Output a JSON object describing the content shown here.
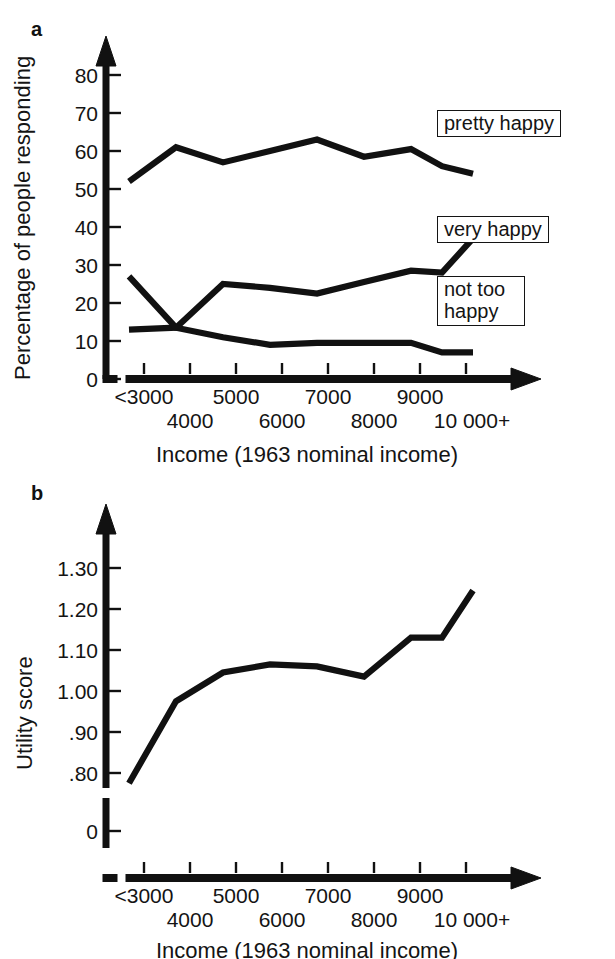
{
  "figure": {
    "panels": [
      {
        "letter": "a",
        "ylabel": "Percentage of people responding",
        "xlabel": "Income (1963 nominal income)"
      },
      {
        "letter": "b",
        "ylabel": "Utility score",
        "xlabel": "Income (1963 nominal income)"
      }
    ],
    "legend": {
      "pretty_happy": "pretty happy",
      "very_happy": "very happy",
      "not_too_happy": "not too\nhappy"
    },
    "colors": {
      "line": "#111111",
      "text": "#141414",
      "background": "#ffffff"
    }
  },
  "chart_data": [
    {
      "type": "line",
      "panel": "a",
      "title": "",
      "xlabel": "Income (1963 nominal income)",
      "ylabel": "Percentage of people responding",
      "categories": [
        "<3000",
        "4000",
        "5000",
        "6000",
        "7000",
        "8000",
        "9000",
        "10 000+"
      ],
      "xtick_labels_row1": [
        "<3000",
        "5000",
        "7000",
        "9000"
      ],
      "xtick_labels_row2": [
        "4000",
        "6000",
        "8000",
        "10 000+"
      ],
      "x": [
        1,
        2,
        3,
        4,
        5,
        6,
        7,
        8,
        9
      ],
      "ylim": [
        0,
        88
      ],
      "ytick_labels": [
        "0",
        "10",
        "20",
        "30",
        "40",
        "50",
        "60",
        "70",
        "80"
      ],
      "ytick_values": [
        0,
        10,
        20,
        30,
        40,
        50,
        60,
        70,
        80
      ],
      "grid": false,
      "legend_position": "inside-right",
      "axis_break_x": true,
      "series": [
        {
          "name": "pretty happy",
          "values": [
            52,
            61,
            57,
            60,
            63,
            58.5,
            60.5,
            56,
            54
          ]
        },
        {
          "name": "very happy",
          "values": [
            13,
            13.5,
            25,
            24,
            22.5,
            25.5,
            28.5,
            28,
            37
          ]
        },
        {
          "name": "not too happy",
          "values": [
            27,
            13.5,
            11,
            9,
            9.5,
            9.5,
            9.5,
            7,
            7
          ]
        }
      ]
    },
    {
      "type": "line",
      "panel": "b",
      "title": "",
      "xlabel": "Income (1963 nominal income)",
      "ylabel": "Utility score",
      "categories": [
        "<3000",
        "4000",
        "5000",
        "6000",
        "7000",
        "8000",
        "9000",
        "10 000+"
      ],
      "xtick_labels_row1": [
        "<3000",
        "5000",
        "7000",
        "9000"
      ],
      "xtick_labels_row2": [
        "4000",
        "6000",
        "8000",
        "10 000+"
      ],
      "x": [
        1,
        2,
        3,
        4,
        5,
        6,
        7,
        8,
        9
      ],
      "ylim": [
        0.72,
        1.35
      ],
      "ytick_labels": [
        "0",
        ".80",
        ".90",
        "1.00",
        "1.10",
        "1.20",
        "1.30"
      ],
      "ytick_values": [
        0,
        0.8,
        0.9,
        1.0,
        1.1,
        1.2,
        1.3
      ],
      "grid": false,
      "axis_break_y": true,
      "axis_break_x": true,
      "series": [
        {
          "name": "utility score",
          "values": [
            0.775,
            0.975,
            1.045,
            1.065,
            1.06,
            1.035,
            1.13,
            1.13,
            1.245
          ]
        }
      ]
    }
  ]
}
